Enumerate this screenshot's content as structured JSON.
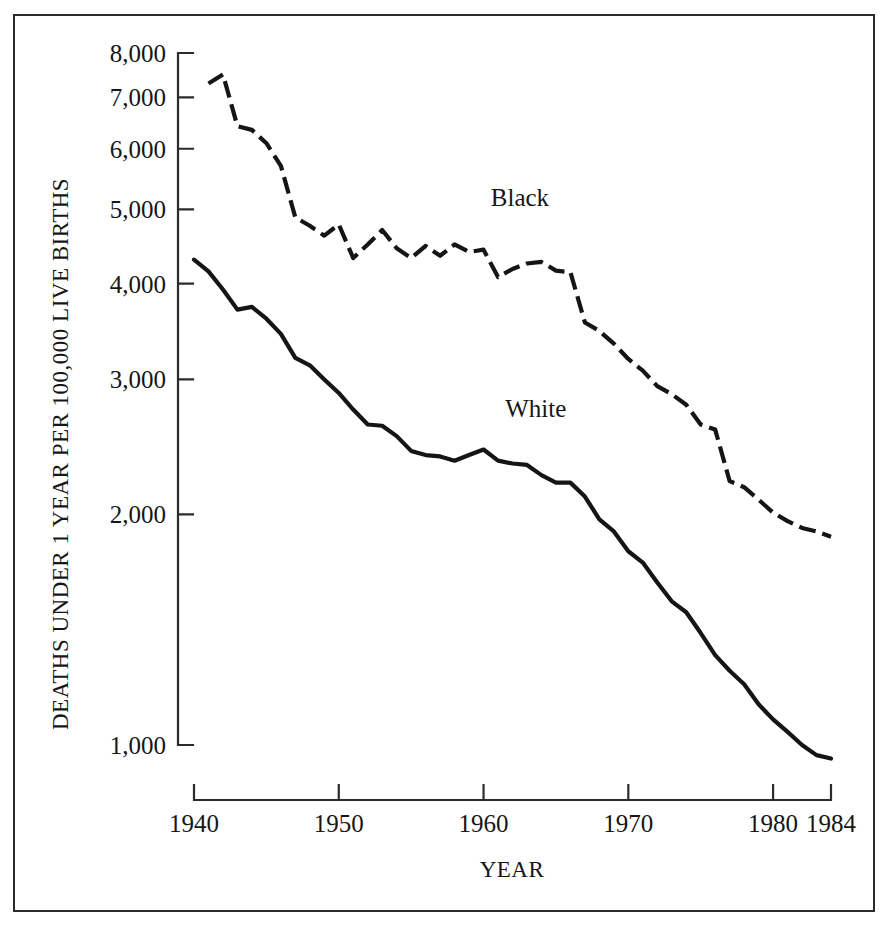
{
  "chart_data": {
    "type": "line",
    "title": "",
    "xlabel": "YEAR",
    "ylabel": "DEATHS UNDER 1 YEAR PER 100,000 LIVE BIRTHS",
    "yscale": "log",
    "ylim": [
      900,
      8200
    ],
    "xlim": [
      1939,
      1985
    ],
    "grid": false,
    "legend_position": "inline-annotation",
    "y_ticks": [
      1000,
      2000,
      3000,
      4000,
      5000,
      6000,
      7000,
      8000
    ],
    "y_tick_labels": [
      "1,000",
      "2,000",
      "3,000",
      "4,000",
      "5,000",
      "6,000",
      "7,000",
      "8,000"
    ],
    "x_ticks": [
      1940,
      1950,
      1960,
      1970,
      1980,
      1984
    ],
    "x_tick_labels": [
      "1940",
      "1950",
      "1960",
      "1970",
      "1980",
      "1984"
    ],
    "series": [
      {
        "name": "Black",
        "style": "dashed",
        "label_x": 1960.5,
        "label_y": 5050,
        "x": [
          1941,
          1942,
          1943,
          1944,
          1945,
          1946,
          1947,
          1948,
          1949,
          1950,
          1951,
          1952,
          1953,
          1954,
          1955,
          1956,
          1957,
          1958,
          1959,
          1960,
          1961,
          1962,
          1963,
          1964,
          1965,
          1966,
          1967,
          1968,
          1969,
          1970,
          1971,
          1972,
          1973,
          1974,
          1975,
          1976,
          1977,
          1978,
          1979,
          1980,
          1981,
          1982,
          1983,
          1984
        ],
        "values": [
          7300,
          7500,
          6420,
          6350,
          6100,
          5700,
          4880,
          4760,
          4620,
          4780,
          4320,
          4500,
          4700,
          4450,
          4320,
          4480,
          4350,
          4500,
          4400,
          4430,
          4080,
          4180,
          4250,
          4270,
          4160,
          4140,
          3560,
          3470,
          3340,
          3190,
          3080,
          2940,
          2870,
          2780,
          2620,
          2580,
          2210,
          2170,
          2090,
          2010,
          1960,
          1920,
          1900,
          1870
        ]
      },
      {
        "name": "White",
        "style": "solid",
        "label_x": 1961.5,
        "label_y": 2680,
        "x": [
          1940,
          1941,
          1942,
          1943,
          1944,
          1945,
          1946,
          1947,
          1948,
          1949,
          1950,
          1951,
          1952,
          1953,
          1954,
          1955,
          1956,
          1957,
          1958,
          1959,
          1960,
          1961,
          1962,
          1963,
          1964,
          1965,
          1966,
          1967,
          1968,
          1969,
          1970,
          1971,
          1972,
          1973,
          1974,
          1975,
          1976,
          1977,
          1978,
          1979,
          1980,
          1981,
          1982,
          1983,
          1984
        ],
        "values": [
          4300,
          4150,
          3930,
          3700,
          3730,
          3600,
          3440,
          3200,
          3130,
          3000,
          2880,
          2740,
          2620,
          2610,
          2530,
          2420,
          2390,
          2380,
          2350,
          2390,
          2430,
          2350,
          2330,
          2320,
          2250,
          2200,
          2200,
          2110,
          1970,
          1900,
          1790,
          1730,
          1630,
          1540,
          1490,
          1400,
          1310,
          1250,
          1200,
          1130,
          1080,
          1040,
          1000,
          970,
          960
        ]
      }
    ]
  },
  "labels": {
    "y_axis_title": "DEATHS UNDER 1 YEAR PER 100,000 LIVE BIRTHS",
    "x_axis_title": "YEAR",
    "series_black": "Black",
    "series_white": "White"
  },
  "colors": {
    "ink": "#151515",
    "border": "#2b2b2b",
    "background": "#ffffff"
  }
}
